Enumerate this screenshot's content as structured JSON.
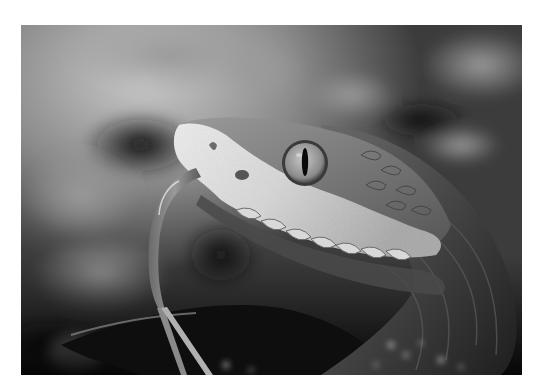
{
  "photo": {
    "alt": "Grayscale close-up photograph of a pit viper's head with its forked tongue extended",
    "subject": "snake",
    "color_mode": "grayscale",
    "palette": {
      "background_dark": "#1a1a1a",
      "background_mid": "#5e5e5e",
      "background_light": "#bdbdbd",
      "head_highlight": "#e6e6e6",
      "body_dark": "#2b2b2b"
    }
  }
}
